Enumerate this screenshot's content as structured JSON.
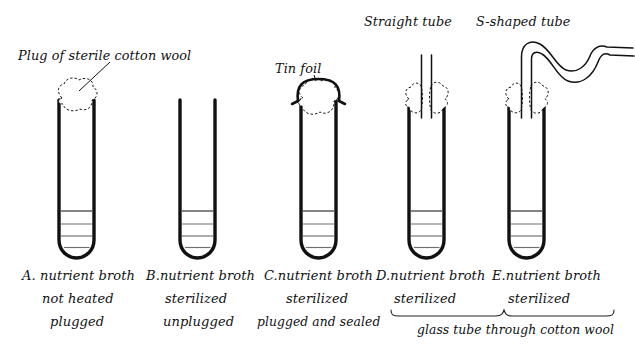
{
  "figure": {
    "title_annotations": {
      "cotton_wool_label": "Plug of sterile cotton wool",
      "tin_foil_label": "Tin foil",
      "straight_tube_label": "Straight tube",
      "s_shaped_tube_label": "S-shaped tube"
    },
    "brace_label": "glass tube through cotton wool",
    "tubes": [
      {
        "id": "A",
        "caption_line1": "A. nutrient broth",
        "caption_line2": "not heated",
        "caption_line3": "plugged",
        "has_cotton_wool": true,
        "has_tin_foil": false,
        "glass_tube": "none"
      },
      {
        "id": "B",
        "caption_line1": "B.nutrient broth",
        "caption_line2": "sterilized",
        "caption_line3": "unplugged",
        "has_cotton_wool": false,
        "has_tin_foil": false,
        "glass_tube": "none"
      },
      {
        "id": "C",
        "caption_line1": "C.nutrient broth",
        "caption_line2": "sterilized",
        "caption_line3": "plugged and sealed",
        "has_cotton_wool": true,
        "has_tin_foil": true,
        "glass_tube": "none"
      },
      {
        "id": "D",
        "caption_line1": "D.nutrient broth",
        "caption_line2": "sterilized",
        "caption_line3": "",
        "has_cotton_wool": true,
        "has_tin_foil": false,
        "glass_tube": "straight"
      },
      {
        "id": "E",
        "caption_line1": "E.nutrient broth",
        "caption_line2": "sterilized",
        "caption_line3": "",
        "has_cotton_wool": true,
        "has_tin_foil": false,
        "glass_tube": "s-shaped"
      }
    ],
    "colors": {
      "ink": "#111111",
      "broth_line": "#6f6f6f",
      "background": "#ffffff"
    }
  }
}
